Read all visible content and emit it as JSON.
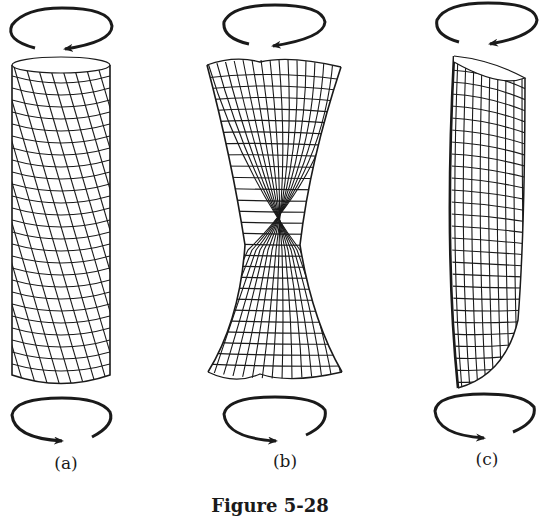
{
  "figure": {
    "caption": "Figure 5-28",
    "ink_color": "#1a1a1a",
    "background": "#ffffff",
    "panels": [
      {
        "id": "a",
        "label": "(a)",
        "shape": "cylinder with helical grid (uniform twist)",
        "label_x": 66,
        "label_y": 455
      },
      {
        "id": "b",
        "label": "(b)",
        "shape": "hourglass twisted grid (necking at middle)",
        "label_x": 285,
        "label_y": 453
      },
      {
        "id": "c",
        "label": "(c)",
        "shape": "leaning bent cylinder with grid",
        "label_x": 487,
        "label_y": 451
      }
    ],
    "arrows": {
      "top": "counter-clockwise rotation arrow above each cylinder",
      "bottom": "clockwise rotation arrow below each cylinder"
    }
  }
}
